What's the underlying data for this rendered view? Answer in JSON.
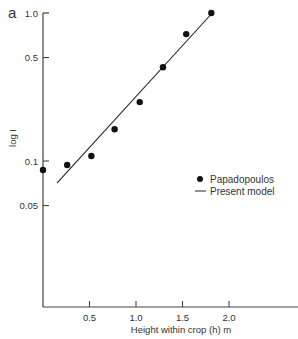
{
  "chart_data": {
    "type": "scatter",
    "panel_label": "a",
    "title": "",
    "xlabel": "Height within crop (h) m",
    "ylabel": "log I",
    "yscale": "log",
    "xlim": [
      0,
      2.7
    ],
    "ylim": [
      0.03,
      1.0
    ],
    "grid": false,
    "legend_position": "right-center",
    "x_ticks": [
      {
        "value": 0.5,
        "label": "0.5"
      },
      {
        "value": 1.0,
        "label": "1.0"
      },
      {
        "value": 1.5,
        "label": "1.5"
      },
      {
        "value": 2.0,
        "label": "2.0"
      }
    ],
    "y_ticks": [
      {
        "value": 1.0,
        "label": "1.0"
      },
      {
        "value": 0.5,
        "label": "0.5"
      },
      {
        "value": 0.1,
        "label": "0.1"
      },
      {
        "value": 0.05,
        "label": "0.05"
      }
    ],
    "series": [
      {
        "name": "Papadopoulos",
        "type": "scatter",
        "marker": "filled-circle",
        "color": "#111111",
        "x": [
          0.0,
          0.26,
          0.52,
          0.77,
          1.04,
          1.29,
          1.54,
          1.81
        ],
        "y": [
          0.087,
          0.094,
          0.108,
          0.164,
          0.25,
          0.43,
          0.72,
          1.0
        ]
      },
      {
        "name": "Present model",
        "type": "line",
        "color": "#222222",
        "x": [
          0.15,
          1.82
        ],
        "y": [
          0.071,
          1.0
        ]
      }
    ]
  },
  "legend": {
    "items": [
      {
        "label": "Papadopoulos",
        "symbol": "dot"
      },
      {
        "label": "Present model",
        "symbol": "line"
      }
    ]
  }
}
